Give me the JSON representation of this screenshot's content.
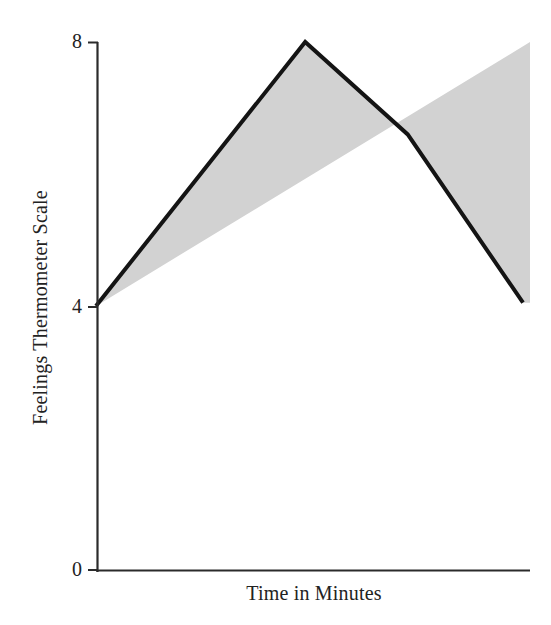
{
  "chart_data": {
    "type": "line",
    "title": "",
    "subtitle": "",
    "xlabel": "Time in Minutes",
    "ylabel": "Feelings Thermometer Scale",
    "ylim": [
      0,
      8
    ],
    "ytick_labels": [
      "0",
      "4",
      "8"
    ],
    "ytick_values": [
      0,
      4,
      8
    ],
    "xtick_labels": [],
    "grid": false,
    "legend": null,
    "annotations": [],
    "series": [
      {
        "name": "Feelings thermometer rating over time",
        "x": [
          0,
          0.49,
          0.73,
          1
        ],
        "values": [
          4.0,
          8.0,
          6.6,
          4.05
        ],
        "line_color": "#141414",
        "line_width_px": 4
      }
    ],
    "shaded_region": {
      "description": "Gray shading filling the area above the plotted line up to the value 8 ceiling",
      "fill_color": "#d2d2d2",
      "upper_bound": 8,
      "lower_bound_series": "Feelings thermometer rating over time"
    },
    "axis_color": "#2b2b2b"
  },
  "axes": {
    "y_axis_name": "Feelings Thermometer Scale",
    "x_axis_name": "Time in Minutes",
    "tick_8": "8",
    "tick_4": "4",
    "tick_0": "0"
  }
}
